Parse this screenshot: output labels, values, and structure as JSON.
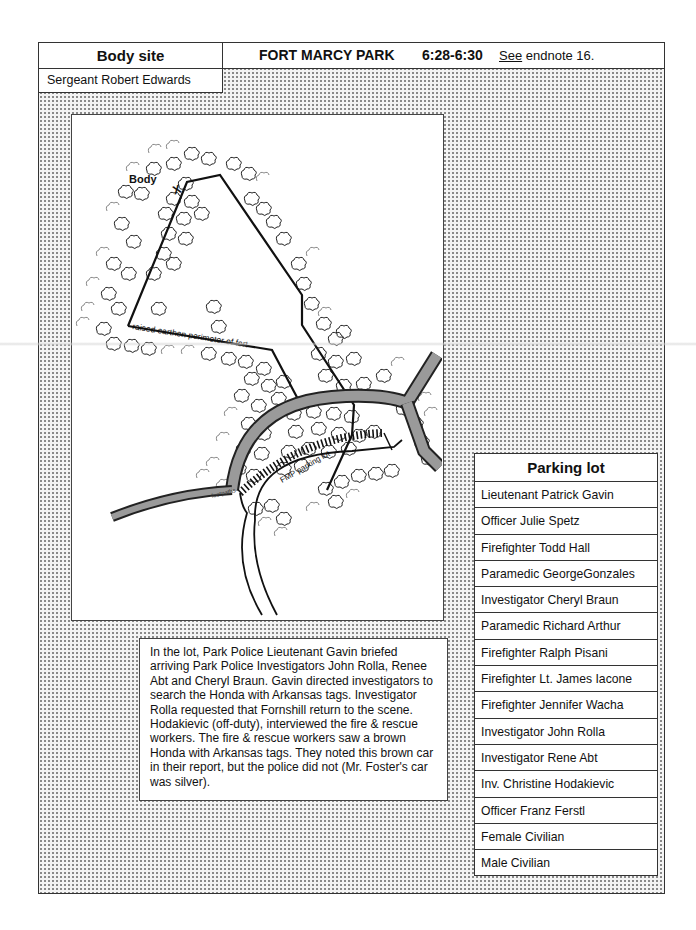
{
  "header": {
    "section_label": "Body site",
    "location": "FORT MARCY PARK",
    "time": "6:28-6:30",
    "note_prefix": "See",
    "note_rest": " endnote 16."
  },
  "body_site": {
    "personnel": [
      "Sergeant Robert Edwards"
    ]
  },
  "map": {
    "labels": {
      "body": "Body",
      "body_marker": "X",
      "perimeter": "raised earthen perimeter of fort",
      "footpaths": "footpaths",
      "parking": "FMP parking lot"
    },
    "icons": [
      "tree-cluster-icon",
      "body-x-marker-icon"
    ]
  },
  "narrative": {
    "text": "In the lot, Park Police Lieutenant Gavin briefed arriving Park Police Investigators John Rolla, Renee Abt and Cheryl Braun.  Gavin directed investigators to search the Honda with Arkansas tags.  Investigator Rolla requested that Fornshill return to the scene.  Hodakievic (off-duty), interviewed the fire & rescue workers.  The fire & rescue workers saw a brown Honda with Arkansas tags.  They noted this brown car in their report, but the police did not (Mr. Foster's car was silver)."
  },
  "parking_lot": {
    "title": "Parking lot",
    "personnel": [
      "Lieutenant Patrick Gavin",
      " Officer Julie Spetz",
      "Firefighter Todd Hall",
      "Paramedic GeorgeGonzales",
      "Investigator Cheryl Braun",
      "Paramedic Richard Arthur",
      "Firefighter Ralph Pisani",
      "Firefighter Lt. James Iacone",
      "Firefighter Jennifer Wacha",
      "Investigator John Rolla",
      "Investigator Rene Abt",
      "Inv. Christine Hodakievic",
      "Officer Franz Ferstl",
      "Female Civilian",
      "Male Civilian"
    ]
  },
  "colors": {
    "ink": "#111111",
    "border": "#333333",
    "shading_dots": "#8a8a8a",
    "road_fill": "#9a9a9a"
  }
}
